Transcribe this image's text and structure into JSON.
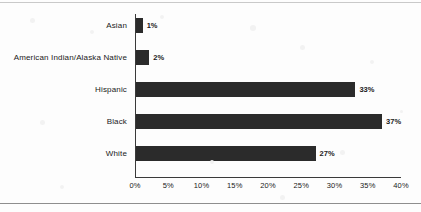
{
  "chart_data": {
    "type": "bar",
    "orientation": "horizontal",
    "title": "",
    "xlabel": "",
    "ylabel": "",
    "categories": [
      "White",
      "Black",
      "Hispanic",
      "American Indian/Alaska Native",
      "Asian"
    ],
    "values": [
      27,
      37,
      33,
      2,
      1
    ],
    "value_labels": [
      "27%",
      "37%",
      "33%",
      "2%",
      "1%"
    ],
    "xlim": [
      0,
      40
    ],
    "xticks": [
      0,
      5,
      10,
      15,
      20,
      25,
      30,
      35,
      40
    ],
    "xtick_labels": [
      "0%",
      "5%",
      "10%",
      "15%",
      "20%",
      "25%",
      "30%",
      "35%",
      "40%"
    ],
    "grid": false,
    "legend": false,
    "bar_color": "#2b2b2b",
    "axis_color": "#3a3a3a",
    "background_color": "#fdfdfd",
    "label_color": "#1a1a1a"
  },
  "bars": [
    {
      "category": "Asian",
      "value": 1,
      "value_label": "1%"
    },
    {
      "category": "American Indian/Alaska Native",
      "value": 2,
      "value_label": "2%"
    },
    {
      "category": "Hispanic",
      "value": 33,
      "value_label": "33%"
    },
    {
      "category": "Black",
      "value": 37,
      "value_label": "37%"
    },
    {
      "category": "White",
      "value": 27,
      "value_label": "27%"
    }
  ],
  "axis": {
    "tick_labels": [
      "0%",
      "5%",
      "10%",
      "15%",
      "20%",
      "25%",
      "30%",
      "35%",
      "40%"
    ]
  }
}
